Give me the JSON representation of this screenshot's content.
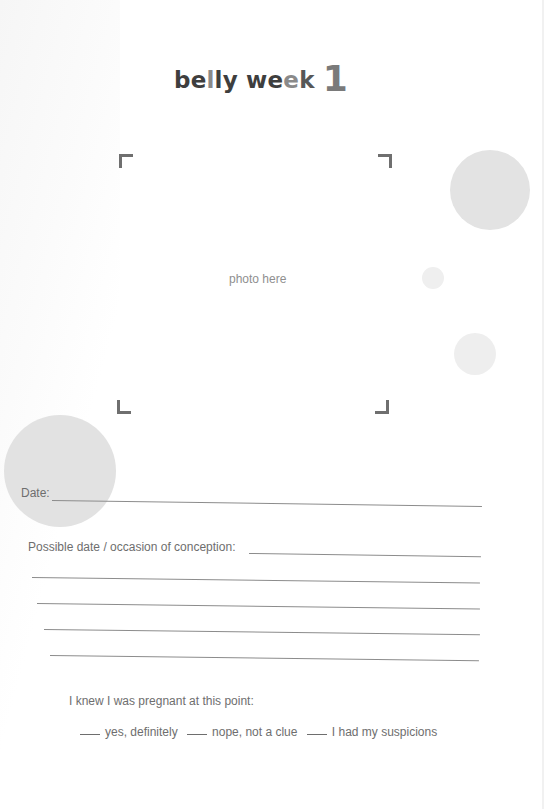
{
  "title": {
    "word1_a": "be",
    "word1_b": "l",
    "word1_c": "ly",
    "word2_a": "we",
    "word2_b": "e",
    "word2_c": "k",
    "number": "1",
    "full_text": "belly week 1"
  },
  "photo_frame": {
    "placeholder": "photo here"
  },
  "fields": {
    "date_label": "Date:",
    "conception_label": "Possible date / occasion of conception:",
    "extra_lines": 4
  },
  "question": {
    "prompt": "I knew I was pregnant at this point:",
    "options": [
      {
        "label": "yes, definitely"
      },
      {
        "label": "nope, not a clue"
      },
      {
        "label": "I had my suspicions"
      }
    ]
  },
  "colors": {
    "title_dark": "#3e3e3e",
    "title_light": "#8a8a8a",
    "number": "#7a7a7a",
    "circle": "#e2e2e2",
    "text": "#6e6e6e",
    "rule": "#8c8c8c"
  }
}
